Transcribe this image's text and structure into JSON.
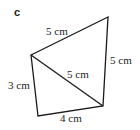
{
  "figure": {
    "tag": "c",
    "vertices": {
      "A": [
        31,
        55
      ],
      "B": [
        108,
        17
      ],
      "C": [
        103,
        106
      ],
      "D": [
        38,
        116
      ]
    },
    "edges": [
      {
        "from": "A",
        "to": "B",
        "label": "5 cm"
      },
      {
        "from": "B",
        "to": "C",
        "label": "5 cm"
      },
      {
        "from": "A",
        "to": "C",
        "label": "5 cm"
      },
      {
        "from": "A",
        "to": "D",
        "label": "3 cm"
      },
      {
        "from": "D",
        "to": "C",
        "label": "4 cm"
      }
    ],
    "stroke_color": "#1a1a1a"
  }
}
